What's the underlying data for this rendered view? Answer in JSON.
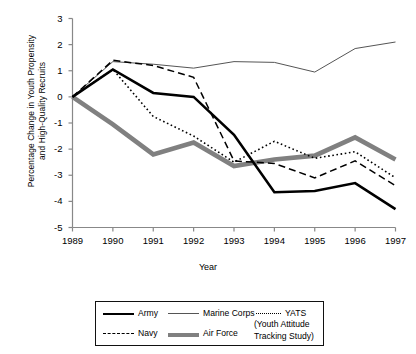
{
  "chart_data": {
    "type": "line",
    "title": "",
    "xlabel": "Year",
    "ylabel": "Percentage Change in Youth Propensity\nand High-Quality Recruits",
    "categories": [
      "1989",
      "1990",
      "1991",
      "1992",
      "1993",
      "1994",
      "1995",
      "1996",
      "1997"
    ],
    "x": [
      1989,
      1990,
      1991,
      1992,
      1993,
      1994,
      1995,
      1996,
      1997
    ],
    "xlim": [
      1989,
      1997
    ],
    "ylim": [
      -5,
      3
    ],
    "yticks": [
      "3",
      "2",
      "1",
      "0",
      "-1",
      "-2",
      "-3",
      "-4",
      "-5"
    ],
    "ytick_values": [
      3,
      2,
      1,
      0,
      -1,
      -2,
      -3,
      -4,
      -5
    ],
    "grid": false,
    "legend_position": "bottom",
    "series": [
      {
        "name": "Army",
        "style": "solid-thick-black",
        "color": "#000000",
        "values": [
          0,
          1.05,
          0.15,
          0.0,
          -1.45,
          -3.65,
          -3.6,
          -3.3,
          -4.3
        ]
      },
      {
        "name": "Navy",
        "style": "dashed-black",
        "color": "#000000",
        "values": [
          0,
          1.4,
          1.2,
          0.75,
          -2.45,
          -2.55,
          -3.1,
          -2.45,
          -3.4
        ]
      },
      {
        "name": "Marine Corps",
        "style": "solid-thin-gray",
        "color": "#555555",
        "values": [
          0,
          1.35,
          1.25,
          1.1,
          1.35,
          1.32,
          0.95,
          1.85,
          2.1
        ]
      },
      {
        "name": "Air Force",
        "style": "solid-extrathick-gray",
        "color": "#808080",
        "values": [
          0,
          -1.05,
          -2.2,
          -1.75,
          -2.65,
          -2.4,
          -2.25,
          -1.55,
          -2.4
        ]
      },
      {
        "name": "YATS",
        "style": "dotted-black",
        "color": "#000000",
        "values": [
          0,
          1.05,
          -0.75,
          -1.5,
          -2.5,
          -1.7,
          -2.35,
          -2.1,
          -3.1
        ]
      }
    ]
  },
  "legend": {
    "items": [
      {
        "label": "Army",
        "swatch": "sw-army"
      },
      {
        "label": "Marine Corps",
        "swatch": "sw-marine"
      },
      {
        "label": "YATS",
        "swatch": "sw-yats"
      },
      {
        "label": "Navy",
        "swatch": "sw-navy"
      },
      {
        "label": "Air Force",
        "swatch": "sw-airforce"
      }
    ],
    "sublabel": "(Youth Attitude\nTracking Study)"
  }
}
